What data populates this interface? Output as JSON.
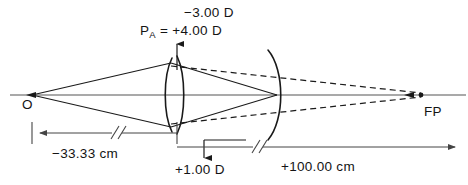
{
  "figure": {
    "type": "optical-ray-diagram",
    "background_color": "#ffffff",
    "stroke_color": "#1a1a1a",
    "axis_color": "#555555"
  },
  "labels": {
    "power_top": "−3.00 D",
    "power_pa_prefix": "P",
    "power_pa_subscript": "A",
    "power_pa_value": " = +4.00 D",
    "object_point": "O",
    "focal_point": "FP",
    "distance_object": "−33.33 cm",
    "power_bottom": "+1.00 D",
    "distance_image": "+100.00 cm"
  },
  "optics": {
    "object_distance_cm": -33.33,
    "image_distance_cm": 100.0,
    "lens_power_d": 1.0,
    "secondary_power_d": -3.0,
    "equivalent_power_pa_d": 4.0
  },
  "geometry": {
    "axis_y": 95,
    "object_x": 32,
    "lens_x": 177,
    "arc_x": 277,
    "focal_x": 421,
    "ray_top_y": 62,
    "ray_bottom_y": 128,
    "dim_line_y": 133,
    "dim_left_x": 32,
    "dim_right_x": 455
  }
}
